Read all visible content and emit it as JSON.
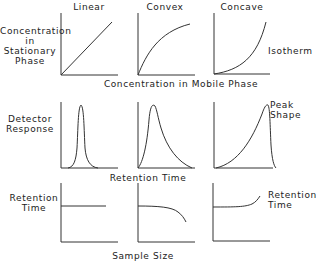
{
  "columns": [
    {
      "key": "linear",
      "label": "Linear"
    },
    {
      "key": "convex",
      "label": "Convex"
    },
    {
      "key": "concave",
      "label": "Concave"
    }
  ],
  "rows": [
    {
      "key": "isotherm",
      "ylabel_lines": [
        "Concentration",
        "in",
        "Stationary",
        "Phase"
      ],
      "xlabel": "Concentration in Mobile Phase",
      "right_label_lines": [
        "Isotherm"
      ]
    },
    {
      "key": "peak-shape",
      "ylabel_lines": [
        "Detector",
        "Response"
      ],
      "xlabel": "Retention Time",
      "right_label_lines": [
        "Peak",
        "Shape"
      ]
    },
    {
      "key": "retention",
      "ylabel_lines": [
        "Retention",
        "Time"
      ],
      "xlabel": "Sample Size",
      "right_label_lines": [
        "Retention",
        "Time"
      ]
    }
  ],
  "curve_descriptions": {
    "isotherm": [
      "straight line through origin",
      "rises steeply then levels off",
      "rises slowly then steepens"
    ],
    "peak-shape": [
      "symmetric narrow peak",
      "sharp front with tailing",
      "leading (fronting) with sharp rear"
    ],
    "retention": [
      "constant",
      "decreases with sample size",
      "increases with sample size"
    ]
  },
  "colors": {
    "ink": "#333333",
    "background": "#ffffff"
  }
}
